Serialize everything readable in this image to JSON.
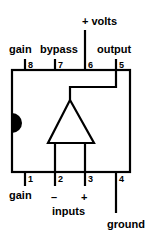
{
  "diagram": {
    "labels": {
      "plus_volts": "+ volts",
      "gain_top": "gain",
      "bypass": "bypass",
      "output": "output",
      "gain_bottom": "gain",
      "minus": "–",
      "plus": "+",
      "inputs": "inputs",
      "ground": "ground"
    },
    "pins": [
      {
        "number": "1",
        "name": "gain"
      },
      {
        "number": "2",
        "name": "– input"
      },
      {
        "number": "3",
        "name": "+ input"
      },
      {
        "number": "4",
        "name": "ground"
      },
      {
        "number": "5",
        "name": "output"
      },
      {
        "number": "6",
        "name": "+ volts"
      },
      {
        "number": "7",
        "name": "bypass"
      },
      {
        "number": "8",
        "name": "gain"
      }
    ],
    "colors": {
      "stroke": "#000000",
      "background": "#ffffff"
    }
  }
}
